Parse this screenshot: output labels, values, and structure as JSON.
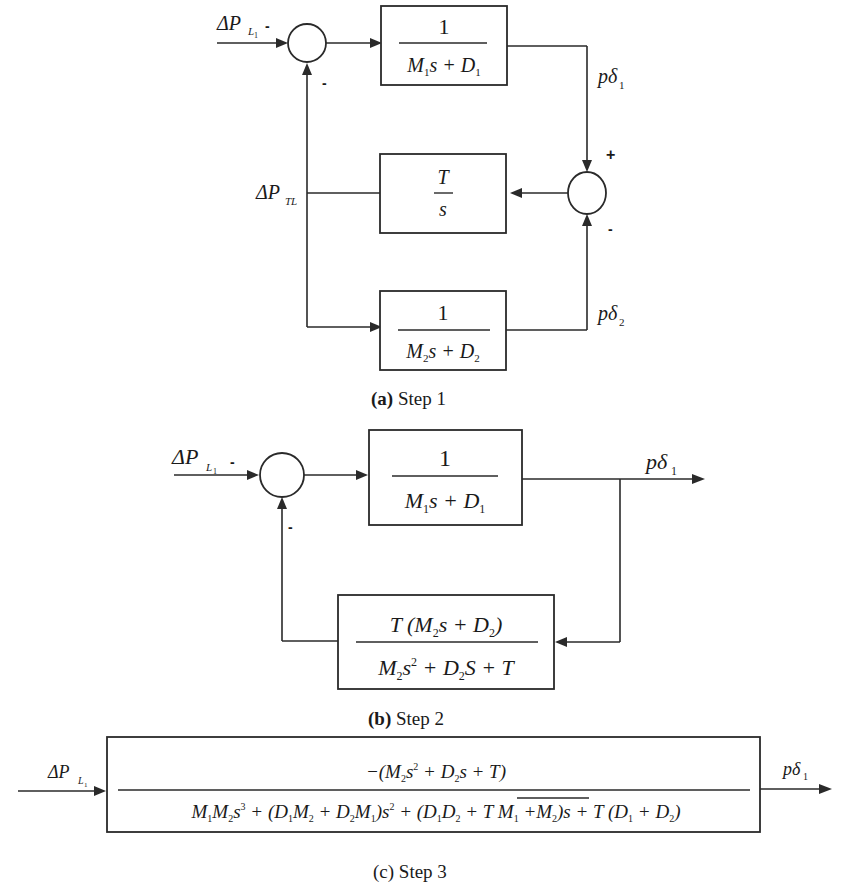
{
  "figure": {
    "steps": [
      {
        "id": "a",
        "caption_letter": "(a)",
        "caption_text": " Step 1",
        "input_label": "ΔP",
        "input_sub": "L₁",
        "summer1_signs": {
          "input": "-",
          "feedback": "-"
        },
        "block_top": {
          "num": "1",
          "den": "M₁s + D₁"
        },
        "block_mid": {
          "num": "T",
          "den": "s"
        },
        "block_bottom": {
          "num": "1",
          "den": "M₂s + D₂"
        },
        "output_top_label": "pδ",
        "output_top_sub": "1",
        "output_bottom_label": "pδ",
        "output_bottom_sub": "2",
        "summer2_signs": {
          "top": "+",
          "bottom": "-"
        },
        "tie_line_label": "ΔP",
        "tie_line_sub": "TL"
      },
      {
        "id": "b",
        "caption_letter": "(b)",
        "caption_text": " Step 2",
        "input_label": "ΔP",
        "input_sub": "L₁",
        "summer_signs": {
          "input": "-",
          "feedback": "-"
        },
        "forward_block": {
          "num": "1",
          "den": "M₁s + D₁"
        },
        "feedback_block": {
          "num": "T (M₂s + D₂)",
          "den": "M₂s² + D₂S + T"
        },
        "output_label": "pδ",
        "output_sub": "1"
      },
      {
        "id": "c",
        "caption_letter": "(c)",
        "caption_text": " Step 3",
        "input_label": "ΔP",
        "input_sub": "L₁",
        "block": {
          "num": "−(M₂s² + D₂s + T)",
          "den": "M₁M₂s³ + (D₁M₂ + D₂M₁)s² + (D₁D₂ + T M₁+M₂)s + T (D₁ + D₂)"
        },
        "output_label": "pδ",
        "output_sub": "1"
      }
    ]
  }
}
